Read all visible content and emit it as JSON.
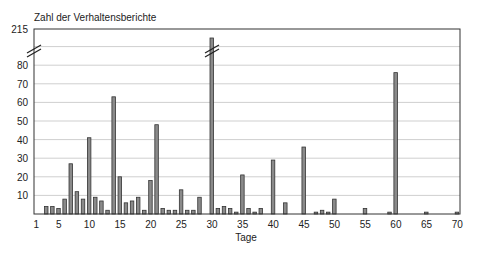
{
  "chart_data": {
    "type": "bar",
    "title": "",
    "ylabel": "Zahl der Verhaltensberichte",
    "xlabel": "Tage",
    "x_ticks": [
      1,
      5,
      10,
      15,
      20,
      25,
      30,
      35,
      40,
      45,
      50,
      55,
      60,
      65,
      70
    ],
    "y_ticks": [
      10,
      20,
      30,
      40,
      50,
      60,
      70,
      80,
      215
    ],
    "y_axis_break": {
      "from": 90,
      "to": 215
    },
    "ylim": [
      0,
      215
    ],
    "xlim": [
      1,
      70
    ],
    "grid": true,
    "legend": null,
    "bar_fill": "#8a8a8a",
    "bar_stroke": "#333333",
    "points": [
      {
        "day": 3,
        "value": 4
      },
      {
        "day": 4,
        "value": 4
      },
      {
        "day": 5,
        "value": 3
      },
      {
        "day": 6,
        "value": 8
      },
      {
        "day": 7,
        "value": 27
      },
      {
        "day": 8,
        "value": 12
      },
      {
        "day": 9,
        "value": 8
      },
      {
        "day": 10,
        "value": 41
      },
      {
        "day": 11,
        "value": 9
      },
      {
        "day": 12,
        "value": 7
      },
      {
        "day": 13,
        "value": 2
      },
      {
        "day": 14,
        "value": 63
      },
      {
        "day": 15,
        "value": 20
      },
      {
        "day": 16,
        "value": 6
      },
      {
        "day": 17,
        "value": 7
      },
      {
        "day": 18,
        "value": 9
      },
      {
        "day": 19,
        "value": 2
      },
      {
        "day": 20,
        "value": 18
      },
      {
        "day": 21,
        "value": 48
      },
      {
        "day": 22,
        "value": 3
      },
      {
        "day": 23,
        "value": 2
      },
      {
        "day": 24,
        "value": 2
      },
      {
        "day": 25,
        "value": 13
      },
      {
        "day": 26,
        "value": 2
      },
      {
        "day": 27,
        "value": 2
      },
      {
        "day": 28,
        "value": 9
      },
      {
        "day": 30,
        "value": 215
      },
      {
        "day": 31,
        "value": 3
      },
      {
        "day": 32,
        "value": 4
      },
      {
        "day": 33,
        "value": 3
      },
      {
        "day": 34,
        "value": 1
      },
      {
        "day": 35,
        "value": 21
      },
      {
        "day": 36,
        "value": 3
      },
      {
        "day": 37,
        "value": 1
      },
      {
        "day": 38,
        "value": 3
      },
      {
        "day": 40,
        "value": 29
      },
      {
        "day": 42,
        "value": 6
      },
      {
        "day": 45,
        "value": 36
      },
      {
        "day": 47,
        "value": 1
      },
      {
        "day": 48,
        "value": 2
      },
      {
        "day": 49,
        "value": 1
      },
      {
        "day": 50,
        "value": 8
      },
      {
        "day": 55,
        "value": 3
      },
      {
        "day": 59,
        "value": 1
      },
      {
        "day": 60,
        "value": 76
      },
      {
        "day": 65,
        "value": 1
      },
      {
        "day": 70,
        "value": 1
      }
    ]
  }
}
